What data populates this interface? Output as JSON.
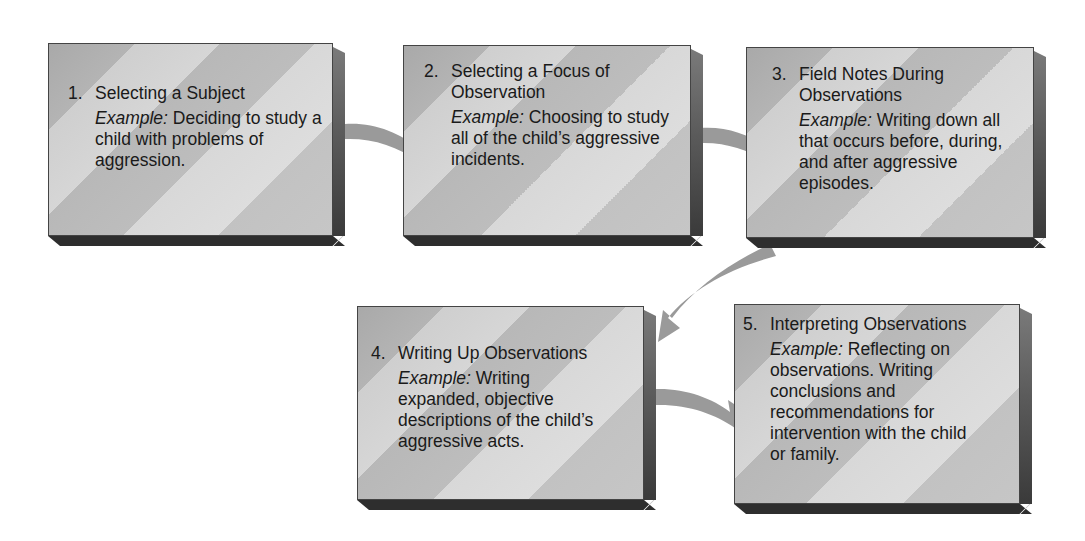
{
  "diagram": {
    "type": "process-flow",
    "colors": {
      "box_face_light": "#d8d8d8",
      "box_face_dark": "#b0b0b0",
      "box_side": "#5b5b5b",
      "box_bottom": "#2e2e2e",
      "arrow": "#9a9a9a",
      "text": "#1a1a1a",
      "background": "#ffffff"
    },
    "steps": [
      {
        "number": "1.",
        "title": "Selecting a Subject",
        "example_label": "Example:",
        "example_text": "Deciding to study a child with problems of aggression."
      },
      {
        "number": "2.",
        "title": "Selecting a Focus of Observation",
        "example_label": "Example:",
        "example_text": "Choosing to study all of the child’s aggressive incidents."
      },
      {
        "number": "3.",
        "title": "Field Notes During Observations",
        "example_label": "Example:",
        "example_text": "Writing down all that occurs before, during, and after aggressive episodes."
      },
      {
        "number": "4.",
        "title": "Writing Up Observations",
        "example_label": "Example:",
        "example_text": "Writing expanded, objective descriptions of the child’s aggressive acts."
      },
      {
        "number": "5.",
        "title": "Interpreting Observations",
        "example_label": "Example:",
        "example_text": "Reflecting on observations. Writing conclusions and recommendations for intervention with the child or family."
      }
    ],
    "connections": [
      {
        "from": 1,
        "to": 2
      },
      {
        "from": 2,
        "to": 3
      },
      {
        "from": 3,
        "to": 4
      },
      {
        "from": 4,
        "to": 5
      }
    ]
  }
}
